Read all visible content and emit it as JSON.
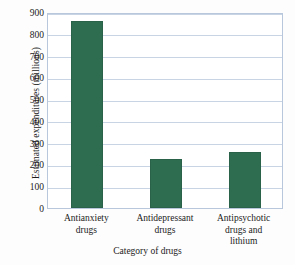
{
  "chart_data": {
    "type": "bar",
    "title": "",
    "xlabel": "Category of drugs",
    "ylabel": "Estimated expenditures (millions)",
    "categories": [
      "Antianxiety\ndrugs",
      "Antidepressant\ndrugs",
      "Antipsychotic\ndrugs and\nlithium"
    ],
    "values": [
      860,
      225,
      255
    ],
    "ylim": [
      0,
      900
    ],
    "yticks": [
      0,
      100,
      200,
      300,
      400,
      500,
      600,
      700,
      800,
      900
    ],
    "ytick_labels": [
      "0",
      "100",
      "200",
      "300",
      "400",
      "500",
      "600",
      "700",
      "800",
      "900"
    ],
    "grid": true,
    "legend": "none",
    "bar_color": "#2f6d50",
    "grid_color": "#c8d4e4",
    "axis_color": "#b9c7dc",
    "background_color": "#ffffff"
  }
}
